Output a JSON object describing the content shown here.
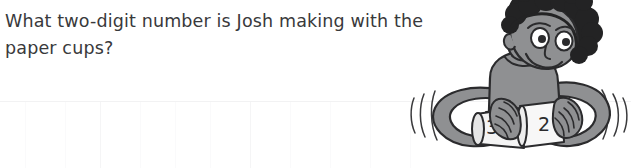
{
  "page": {
    "background_color": "#ffffff",
    "width": 631,
    "height": 168
  },
  "question": {
    "line1": "What two-digit number is Josh making with the",
    "line2": "paper cups?",
    "full_text": "What two-digit number is Josh making with the paper cups?",
    "text_color": "#39393b"
  },
  "illustration": {
    "name": "boy-holding-paper-cups",
    "description": "Cartoon boy with curly dark hair holding two nested paper cups, arms spread, motion lines on both sides",
    "character_name": "Josh",
    "cups": [
      {
        "label": "30",
        "position": "left"
      },
      {
        "label": "2",
        "position": "right"
      }
    ],
    "colors": {
      "skin": "#8f9092",
      "skin_shadow": "#7a7b7d",
      "hair": "#232324",
      "shirt": "#8f9092",
      "cup": "#f4f4f4",
      "cup_shade": "#dcdcdc",
      "outline": "#2b2b2d",
      "eye_white": "#ffffff"
    },
    "motion_lines": {
      "left_count": 3,
      "right_count": 3
    }
  },
  "ruling": {
    "horizontal_line_y": 101,
    "horizontal_color": "#f2f2f3",
    "vertical_lines_x": [
      25,
      65,
      100,
      140,
      175,
      210,
      250,
      290,
      330,
      370,
      410
    ],
    "vertical_color": "#fafafb"
  }
}
